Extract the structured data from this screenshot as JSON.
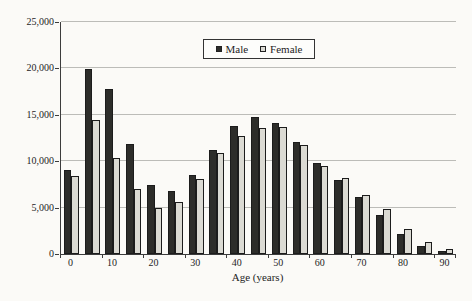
{
  "chart_data": {
    "type": "bar",
    "xlabel": "Age (years)",
    "ylabel": "",
    "categories": [
      0,
      5,
      10,
      15,
      20,
      25,
      30,
      35,
      40,
      45,
      50,
      55,
      60,
      65,
      70,
      75,
      80,
      85,
      90
    ],
    "x_tick_labels": [
      "0",
      "10",
      "20",
      "30",
      "40",
      "50",
      "60",
      "70",
      "80",
      "90"
    ],
    "series": [
      {
        "name": "Male",
        "color": "#2d2d2a",
        "values": [
          9100,
          19900,
          17800,
          11900,
          7400,
          6800,
          8500,
          11200,
          13800,
          14800,
          14100,
          12100,
          9800,
          8000,
          6100,
          4200,
          2200,
          900,
          300
        ]
      },
      {
        "name": "Female",
        "color": "#dbdad3",
        "values": [
          8400,
          14400,
          10300,
          7000,
          5000,
          5600,
          8100,
          10900,
          12700,
          13600,
          13700,
          11700,
          9500,
          8200,
          6400,
          4800,
          2700,
          1300,
          500
        ]
      }
    ],
    "ylim": [
      0,
      25000
    ],
    "ytick_step": 5000,
    "ytick_labels": [
      "0",
      "5,000",
      "10,000",
      "15,000",
      "20,000",
      "25,000"
    ],
    "grid": true,
    "legend_position": "top-center"
  },
  "colors": {
    "background": "#fbfaf7",
    "axis": "#3c3c3c",
    "gridline": "#bcbcb8",
    "text": "#1e1e1e",
    "male_bar": "#2d2d2a",
    "female_bar": "#dbdad3",
    "bar_border": "#1c1c1c"
  }
}
